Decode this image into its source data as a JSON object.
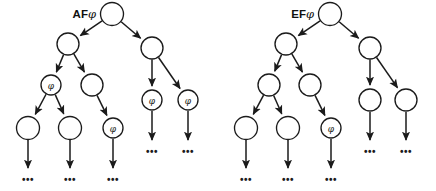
{
  "figure": {
    "caption": "",
    "background_color": "#ffffff",
    "stroke_color": "#1b1b1b",
    "node_fill_color": "#ffffff",
    "width": 436,
    "height": 191
  },
  "trees": [
    {
      "id": "af-tree",
      "title_prefix": "AF",
      "title_symbol": "φ",
      "title_full": "AFφ",
      "title_x": 96,
      "title_y": 14,
      "nodes": [
        {
          "id": "af-root",
          "cx": 112,
          "cy": 14,
          "r": 11.5,
          "label": ""
        },
        {
          "id": "af-n1",
          "cx": 68,
          "cy": 44,
          "r": 11.0,
          "label": ""
        },
        {
          "id": "af-n2",
          "cx": 152,
          "cy": 48,
          "r": 11.0,
          "label": ""
        },
        {
          "id": "af-n3",
          "cx": 51,
          "cy": 85,
          "r": 10.0,
          "label": "φ"
        },
        {
          "id": "af-n4",
          "cx": 92,
          "cy": 85,
          "r": 11.0,
          "label": ""
        },
        {
          "id": "af-n5",
          "cx": 152,
          "cy": 100,
          "r": 10.0,
          "label": "φ"
        },
        {
          "id": "af-n6",
          "cx": 188,
          "cy": 100,
          "r": 10.0,
          "label": "φ"
        },
        {
          "id": "af-n7",
          "cx": 28,
          "cy": 128,
          "r": 11.5,
          "label": ""
        },
        {
          "id": "af-n8",
          "cx": 70,
          "cy": 128,
          "r": 11.5,
          "label": ""
        },
        {
          "id": "af-n9",
          "cx": 113,
          "cy": 128,
          "r": 10.0,
          "label": "φ"
        }
      ],
      "edges": [
        {
          "from": "af-root",
          "to": "af-n1"
        },
        {
          "from": "af-root",
          "to": "af-n2"
        },
        {
          "from": "af-n1",
          "to": "af-n3"
        },
        {
          "from": "af-n1",
          "to": "af-n4"
        },
        {
          "from": "af-n2",
          "to": "af-n5"
        },
        {
          "from": "af-n2",
          "to": "af-n6"
        },
        {
          "from": "af-n3",
          "to": "af-n7"
        },
        {
          "from": "af-n3",
          "to": "af-n8"
        },
        {
          "from": "af-n4",
          "to": "af-n9"
        }
      ],
      "open_arrows": [
        {
          "id": "af-open-1",
          "x": 28,
          "y1": 140,
          "y2": 168
        },
        {
          "id": "af-open-2",
          "x": 70,
          "y1": 140,
          "y2": 168
        },
        {
          "id": "af-open-3",
          "x": 113,
          "y1": 139,
          "y2": 168
        },
        {
          "id": "af-open-4",
          "x": 152,
          "y1": 111,
          "y2": 140
        },
        {
          "id": "af-open-5",
          "x": 188,
          "y1": 111,
          "y2": 140
        }
      ],
      "ellipses": [
        {
          "id": "af-ell-1",
          "text": "•••",
          "x": 28,
          "y": 179
        },
        {
          "id": "af-ell-2",
          "text": "•••",
          "x": 70,
          "y": 179
        },
        {
          "id": "af-ell-3",
          "text": "•••",
          "x": 113,
          "y": 179
        },
        {
          "id": "af-ell-4",
          "text": "•••",
          "x": 152,
          "y": 151
        },
        {
          "id": "af-ell-5",
          "text": "•••",
          "x": 188,
          "y": 151
        }
      ]
    },
    {
      "id": "ef-tree",
      "title_prefix": "EF",
      "title_symbol": "φ",
      "title_full": "EFφ",
      "title_x": 314,
      "title_y": 14,
      "nodes": [
        {
          "id": "ef-root",
          "cx": 330,
          "cy": 14,
          "r": 11.5,
          "label": ""
        },
        {
          "id": "ef-n1",
          "cx": 286,
          "cy": 44,
          "r": 11.0,
          "label": ""
        },
        {
          "id": "ef-n2",
          "cx": 370,
          "cy": 48,
          "r": 11.0,
          "label": ""
        },
        {
          "id": "ef-n3",
          "cx": 269,
          "cy": 85,
          "r": 11.0,
          "label": ""
        },
        {
          "id": "ef-n4",
          "cx": 310,
          "cy": 85,
          "r": 11.0,
          "label": ""
        },
        {
          "id": "ef-n5",
          "cx": 370,
          "cy": 100,
          "r": 11.0,
          "label": ""
        },
        {
          "id": "ef-n6",
          "cx": 406,
          "cy": 100,
          "r": 11.0,
          "label": ""
        },
        {
          "id": "ef-n7",
          "cx": 246,
          "cy": 128,
          "r": 11.5,
          "label": ""
        },
        {
          "id": "ef-n8",
          "cx": 288,
          "cy": 128,
          "r": 11.5,
          "label": ""
        },
        {
          "id": "ef-n9",
          "cx": 331,
          "cy": 128,
          "r": 10.0,
          "label": "φ"
        }
      ],
      "edges": [
        {
          "from": "ef-root",
          "to": "ef-n1"
        },
        {
          "from": "ef-root",
          "to": "ef-n2"
        },
        {
          "from": "ef-n1",
          "to": "ef-n3"
        },
        {
          "from": "ef-n1",
          "to": "ef-n4"
        },
        {
          "from": "ef-n2",
          "to": "ef-n5"
        },
        {
          "from": "ef-n2",
          "to": "ef-n6"
        },
        {
          "from": "ef-n3",
          "to": "ef-n7"
        },
        {
          "from": "ef-n3",
          "to": "ef-n8"
        },
        {
          "from": "ef-n4",
          "to": "ef-n9"
        }
      ],
      "open_arrows": [
        {
          "id": "ef-open-1",
          "x": 246,
          "y1": 140,
          "y2": 168
        },
        {
          "id": "ef-open-2",
          "x": 288,
          "y1": 140,
          "y2": 168
        },
        {
          "id": "ef-open-3",
          "x": 331,
          "y1": 139,
          "y2": 168
        },
        {
          "id": "ef-open-4",
          "x": 370,
          "y1": 112,
          "y2": 140
        },
        {
          "id": "ef-open-5",
          "x": 406,
          "y1": 112,
          "y2": 140
        }
      ],
      "ellipses": [
        {
          "id": "ef-ell-1",
          "text": "•••",
          "x": 246,
          "y": 179
        },
        {
          "id": "ef-ell-2",
          "text": "•••",
          "x": 288,
          "y": 179
        },
        {
          "id": "ef-ell-3",
          "text": "•••",
          "x": 331,
          "y": 179
        },
        {
          "id": "ef-ell-4",
          "text": "•••",
          "x": 370,
          "y": 151
        },
        {
          "id": "ef-ell-5",
          "text": "•••",
          "x": 406,
          "y": 151
        }
      ]
    }
  ]
}
